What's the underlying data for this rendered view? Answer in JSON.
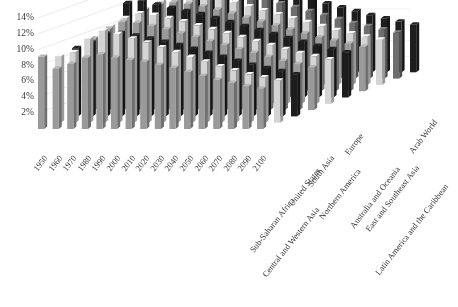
{
  "chart_data": {
    "type": "bar",
    "render": "3d-bar",
    "title": "",
    "subtitle": "",
    "xlabel": "",
    "ylabel": "",
    "ylim": [
      0,
      14
    ],
    "ytick_values": [
      2,
      4,
      6,
      8,
      10,
      12,
      14
    ],
    "ytick_labels": [
      "2%",
      "4%",
      "6%",
      "8%",
      "10%",
      "12%",
      "14%"
    ],
    "grid": true,
    "legend": "none",
    "categories": [
      "1950",
      "1960",
      "1970",
      "1980",
      "1990",
      "2000",
      "2010",
      "2020",
      "2030",
      "2040",
      "2050",
      "2060",
      "2070",
      "2080",
      "2090",
      "2100"
    ],
    "series": [
      {
        "name": "Sub-Saharan Africa",
        "color": "#9a9a9a",
        "values": [
          9.1,
          7.6,
          8.2,
          9.0,
          9.4,
          9.0,
          8.7,
          8.5,
          8.1,
          7.7,
          7.2,
          6.7,
          6.2,
          5.8,
          5.4,
          5.1
        ]
      },
      {
        "name": "Central and Western Asia",
        "color": "#d4d4d4",
        "values": [
          8.4,
          8.9,
          10.6,
          11.6,
          11.2,
          10.6,
          10.1,
          9.5,
          8.9,
          8.3,
          7.7,
          7.1,
          6.6,
          6.1,
          5.7,
          5.3
        ]
      },
      {
        "name": "United States",
        "color": "#1d1d1d",
        "values": [
          8.6,
          9.3,
          10.4,
          10.5,
          10.2,
          9.8,
          9.4,
          9.0,
          8.5,
          8.0,
          7.5,
          7.0,
          6.5,
          6.1,
          5.7,
          5.3
        ]
      },
      {
        "name": "South Asia",
        "color": "#9a9a9a",
        "values": [
          9.0,
          10.2,
          11.1,
          11.0,
          10.6,
          10.2,
          9.7,
          9.2,
          8.7,
          8.2,
          7.7,
          7.2,
          6.7,
          6.2,
          5.8,
          5.4
        ]
      },
      {
        "name": "Northern America",
        "color": "#d4d4d4",
        "values": [
          9.8,
          10.8,
          11.4,
          11.2,
          10.8,
          10.4,
          9.9,
          9.4,
          8.9,
          8.4,
          7.9,
          7.4,
          6.9,
          6.4,
          6.0,
          5.6
        ]
      },
      {
        "name": "Europe",
        "color": "#1d1d1d",
        "values": [
          11.9,
          12.2,
          11.7,
          11.3,
          10.9,
          10.5,
          10.0,
          9.5,
          9.0,
          8.5,
          8.0,
          7.5,
          7.0,
          6.5,
          6.1,
          5.7
        ]
      },
      {
        "name": "Australia and Oceania",
        "color": "#9a9a9a",
        "values": [
          10.3,
          10.9,
          11.2,
          11.0,
          10.7,
          10.3,
          9.8,
          9.3,
          8.8,
          8.3,
          7.8,
          7.3,
          6.8,
          6.4,
          6.0,
          5.6
        ]
      },
      {
        "name": "East and Southeast Asia",
        "color": "#d4d4d4",
        "values": [
          10.6,
          11.3,
          11.5,
          11.2,
          10.8,
          10.4,
          9.9,
          9.4,
          8.9,
          8.4,
          7.9,
          7.4,
          6.9,
          6.5,
          6.1,
          5.7
        ]
      },
      {
        "name": "Latin America and the Caribbean",
        "color": "#6e6e6e",
        "values": [
          10.9,
          11.4,
          11.6,
          11.3,
          10.9,
          10.5,
          10.0,
          9.5,
          9.0,
          8.5,
          8.0,
          7.5,
          7.0,
          6.6,
          6.2,
          5.8
        ]
      },
      {
        "name": "Arab World",
        "color": "#1d1d1d",
        "values": [
          11.2,
          11.8,
          11.9,
          11.5,
          11.1,
          10.7,
          10.2,
          9.7,
          9.2,
          8.7,
          8.2,
          7.7,
          7.2,
          6.8,
          6.4,
          6.0
        ]
      }
    ]
  }
}
